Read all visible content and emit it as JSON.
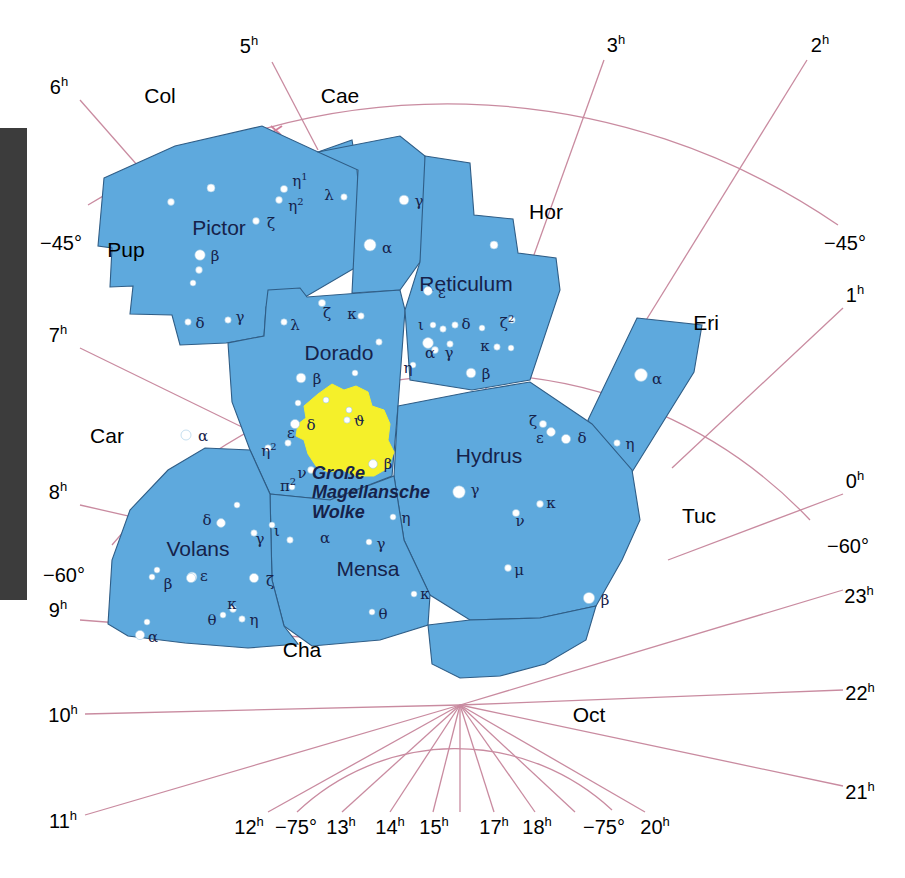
{
  "chart": {
    "colors": {
      "constellation_fill": "#5ea9dd",
      "constellation_border": "#2f5d86",
      "grid_line": "#c98ba0",
      "nebula_fill": "#f5f02a",
      "star_fill": "#ffffff",
      "star_stroke": "#9fc9e4",
      "label_dark": "#16224a",
      "label_black": "#000000",
      "edge_bar": "#3c3c3c",
      "background": "#ffffff"
    }
  },
  "coordinate_labels": [
    {
      "text": "5",
      "sup": "h",
      "x": 249,
      "y": 45
    },
    {
      "text": "3",
      "sup": "h",
      "x": 616,
      "y": 44
    },
    {
      "text": "2",
      "sup": "h",
      "x": 820,
      "y": 44
    },
    {
      "text": "6",
      "sup": "h",
      "x": 59,
      "y": 86
    },
    {
      "text": "−45°",
      "sup": "",
      "x": 61,
      "y": 243
    },
    {
      "text": "−45°",
      "sup": "",
      "x": 845,
      "y": 243
    },
    {
      "text": "1",
      "sup": "h",
      "x": 855,
      "y": 294
    },
    {
      "text": "7",
      "sup": "h",
      "x": 58,
      "y": 334
    },
    {
      "text": "0",
      "sup": "h",
      "x": 855,
      "y": 480
    },
    {
      "text": "8",
      "sup": "h",
      "x": 58,
      "y": 491
    },
    {
      "text": "−60°",
      "sup": "",
      "x": 848,
      "y": 546
    },
    {
      "text": "−60°",
      "sup": "",
      "x": 64,
      "y": 575
    },
    {
      "text": "9",
      "sup": "h",
      "x": 58,
      "y": 609
    },
    {
      "text": "23",
      "sup": "h",
      "x": 859,
      "y": 595
    },
    {
      "text": "22",
      "sup": "h",
      "x": 860,
      "y": 692
    },
    {
      "text": "10",
      "sup": "h",
      "x": 63,
      "y": 714
    },
    {
      "text": "21",
      "sup": "h",
      "x": 860,
      "y": 791
    },
    {
      "text": "11",
      "sup": "h",
      "x": 63,
      "y": 820
    },
    {
      "text": "12",
      "sup": "h",
      "x": 249,
      "y": 826
    },
    {
      "text": "−75°",
      "sup": "",
      "x": 296,
      "y": 827
    },
    {
      "text": "13",
      "sup": "h",
      "x": 341,
      "y": 826
    },
    {
      "text": "14",
      "sup": "h",
      "x": 390,
      "y": 826
    },
    {
      "text": "15",
      "sup": "h",
      "x": 434,
      "y": 826
    },
    {
      "text": "17",
      "sup": "h",
      "x": 494,
      "y": 826
    },
    {
      "text": "18",
      "sup": "h",
      "x": 537,
      "y": 826
    },
    {
      "text": "−75°",
      "sup": "",
      "x": 604,
      "y": 827
    },
    {
      "text": "20",
      "sup": "h",
      "x": 655,
      "y": 826
    }
  ],
  "constellation_abbrs": [
    {
      "label": "Col",
      "x": 160,
      "y": 95
    },
    {
      "label": "Cae",
      "x": 340,
      "y": 95
    },
    {
      "label": "Hor",
      "x": 546,
      "y": 211
    },
    {
      "label": "Eri",
      "x": 706,
      "y": 322
    },
    {
      "label": "Pup",
      "x": 126,
      "y": 249
    },
    {
      "label": "Car",
      "x": 107,
      "y": 435
    },
    {
      "label": "Tuc",
      "x": 699,
      "y": 515
    },
    {
      "label": "Cha",
      "x": 302,
      "y": 649
    },
    {
      "label": "Oct",
      "x": 589,
      "y": 714
    }
  ],
  "constellation_names": [
    {
      "label": "Pictor",
      "x": 219,
      "y": 227
    },
    {
      "label": "Reticulum",
      "x": 466,
      "y": 283
    },
    {
      "label": "Dorado",
      "x": 339,
      "y": 352
    },
    {
      "label": "Hydrus",
      "x": 489,
      "y": 455
    },
    {
      "label": "Volans",
      "x": 198,
      "y": 548
    },
    {
      "label": "Mensa",
      "x": 368,
      "y": 568
    }
  ],
  "nebula_label": {
    "line1": "Große",
    "line2": "Magellansche",
    "line3": "Wolke",
    "x": 312,
    "y": 464
  },
  "stars": [
    {
      "x": 211,
      "y": 188,
      "r": 4.0
    },
    {
      "x": 171,
      "y": 202,
      "r": 3.4
    },
    {
      "x": 284,
      "y": 189,
      "r": 3.6,
      "label": "η",
      "sup": "1",
      "lx": 300,
      "ly": 180
    },
    {
      "x": 279,
      "y": 200,
      "r": 3.4,
      "label": "η",
      "sup": "2",
      "lx": 296,
      "ly": 205
    },
    {
      "x": 344,
      "y": 197,
      "r": 3.2,
      "label": "λ",
      "lx": 329,
      "ly": 195
    },
    {
      "x": 256,
      "y": 221,
      "r": 3.4,
      "label": "ζ",
      "lx": 271,
      "ly": 223
    },
    {
      "x": 404,
      "y": 200,
      "r": 4.8,
      "label": "γ",
      "lx": 419,
      "ly": 201
    },
    {
      "x": 200,
      "y": 255,
      "r": 5.2,
      "label": "β",
      "lx": 215,
      "ly": 256
    },
    {
      "x": 199,
      "y": 270,
      "r": 3.4
    },
    {
      "x": 193,
      "y": 283,
      "r": 3.0
    },
    {
      "x": 370,
      "y": 245,
      "r": 6.0,
      "label": "α",
      "lx": 387,
      "ly": 248
    },
    {
      "x": 228,
      "y": 320,
      "r": 3.2,
      "label": "γ",
      "lx": 240,
      "ly": 317
    },
    {
      "x": 188,
      "y": 322,
      "r": 3.2,
      "label": "δ",
      "lx": 200,
      "ly": 323
    },
    {
      "x": 284,
      "y": 322,
      "r": 3.2,
      "label": "λ",
      "lx": 295,
      "ly": 325
    },
    {
      "x": 322,
      "y": 303,
      "r": 3.6,
      "label": "ζ",
      "lx": 327,
      "ly": 313
    },
    {
      "x": 361,
      "y": 316,
      "r": 3.2,
      "label": "κ",
      "lx": 352,
      "ly": 314
    },
    {
      "x": 379,
      "y": 342,
      "r": 3.2
    },
    {
      "x": 301,
      "y": 378,
      "r": 4.8,
      "label": "β",
      "lx": 317,
      "ly": 379
    },
    {
      "x": 355,
      "y": 373,
      "r": 3.0
    },
    {
      "x": 298,
      "y": 403,
      "r": 3.0
    },
    {
      "x": 326,
      "y": 400,
      "r": 3.0
    },
    {
      "x": 349,
      "y": 410,
      "r": 3.0
    },
    {
      "x": 295,
      "y": 424,
      "r": 4.6,
      "label": "δ",
      "lx": 311,
      "ly": 425
    },
    {
      "x": 288,
      "y": 443,
      "r": 3.2,
      "label": "ε",
      "lx": 291,
      "ly": 433
    },
    {
      "x": 268,
      "y": 448,
      "r": 3.2,
      "label": "η",
      "sup": "2",
      "lx": 269,
      "ly": 450
    },
    {
      "x": 311,
      "y": 470,
      "r": 3.4,
      "label": "ν",
      "lx": 302,
      "ly": 473
    },
    {
      "x": 292,
      "y": 487,
      "r": 3.0,
      "label": "π",
      "sup": "2",
      "lx": 288,
      "ly": 485
    },
    {
      "x": 428,
      "y": 291,
      "r": 4.4,
      "label": "ε",
      "lx": 442,
      "ly": 293
    },
    {
      "x": 433,
      "y": 325,
      "r": 3.0,
      "label": "ι",
      "lx": 421,
      "ly": 325
    },
    {
      "x": 443,
      "y": 329,
      "r": 3.2
    },
    {
      "x": 455,
      "y": 325,
      "r": 3.2,
      "label": "δ",
      "lx": 466,
      "ly": 324
    },
    {
      "x": 482,
      "y": 328,
      "r": 3.0
    },
    {
      "x": 512,
      "y": 320,
      "r": 3.2,
      "label": "ζ",
      "sup": "2",
      "lx": 507,
      "ly": 322
    },
    {
      "x": 428,
      "y": 343,
      "r": 5.4
    },
    {
      "x": 435,
      "y": 350,
      "r": 3.4,
      "label": "α",
      "lx": 430,
      "ly": 353
    },
    {
      "x": 450,
      "y": 344,
      "r": 3.2,
      "label": "γ",
      "lx": 449,
      "ly": 353
    },
    {
      "x": 497,
      "y": 347,
      "r": 3.2,
      "label": "κ",
      "lx": 485,
      "ly": 346
    },
    {
      "x": 511,
      "y": 348,
      "r": 3.0
    },
    {
      "x": 413,
      "y": 365,
      "r": 3.0,
      "label": "η",
      "lx": 408,
      "ly": 368
    },
    {
      "x": 471,
      "y": 373,
      "r": 4.8,
      "label": "β",
      "lx": 486,
      "ly": 374
    },
    {
      "x": 494,
      "y": 245,
      "r": 4.0
    },
    {
      "x": 641,
      "y": 375,
      "r": 6.4,
      "label": "α",
      "lx": 657,
      "ly": 379
    },
    {
      "x": 617,
      "y": 443,
      "r": 3.2,
      "label": "η",
      "lx": 630,
      "ly": 444
    },
    {
      "x": 543,
      "y": 424,
      "r": 3.6,
      "label": "ζ",
      "lx": 533,
      "ly": 421
    },
    {
      "x": 551,
      "y": 432,
      "r": 4.4,
      "label": "ε",
      "lx": 540,
      "ly": 438
    },
    {
      "x": 566,
      "y": 439,
      "r": 4.6,
      "label": "δ",
      "lx": 582,
      "ly": 438
    },
    {
      "x": 459,
      "y": 492,
      "r": 6.2,
      "label": "γ",
      "lx": 475,
      "ly": 490
    },
    {
      "x": 516,
      "y": 513,
      "r": 3.6,
      "label": "ν",
      "lx": 520,
      "ly": 521
    },
    {
      "x": 540,
      "y": 504,
      "r": 3.4,
      "label": "κ",
      "lx": 551,
      "ly": 503
    },
    {
      "x": 508,
      "y": 568,
      "r": 3.4,
      "label": "μ",
      "lx": 519,
      "ly": 570
    },
    {
      "x": 589,
      "y": 598,
      "r": 5.6,
      "label": "β",
      "lx": 605,
      "ly": 600
    },
    {
      "x": 186,
      "y": 435,
      "r": 5.0,
      "label": "α",
      "lx": 203,
      "ly": 436
    },
    {
      "x": 237,
      "y": 505,
      "r": 3.0
    },
    {
      "x": 221,
      "y": 523,
      "r": 4.4,
      "label": "δ",
      "lx": 207,
      "ly": 520
    },
    {
      "x": 254,
      "y": 533,
      "r": 3.2,
      "label": "γ",
      "lx": 260,
      "ly": 539
    },
    {
      "x": 272,
      "y": 525,
      "r": 3.0,
      "label": "ι",
      "lx": 277,
      "ly": 531
    },
    {
      "x": 192,
      "y": 577,
      "r": 4.8,
      "label": "β",
      "lx": 168,
      "ly": 584
    },
    {
      "x": 152,
      "y": 577,
      "r": 3.0
    },
    {
      "x": 157,
      "y": 570,
      "r": 3.0
    },
    {
      "x": 191,
      "y": 578,
      "r": 4.6,
      "label": "ε",
      "lx": 204,
      "ly": 576
    },
    {
      "x": 254,
      "y": 578,
      "r": 4.6,
      "label": "ζ",
      "lx": 270,
      "ly": 581
    },
    {
      "x": 223,
      "y": 615,
      "r": 3.0,
      "label": "θ",
      "lx": 212,
      "ly": 620
    },
    {
      "x": 233,
      "y": 609,
      "r": 3.4,
      "label": "κ",
      "lx": 232,
      "ly": 604
    },
    {
      "x": 242,
      "y": 619,
      "r": 3.2,
      "label": "η",
      "lx": 254,
      "ly": 620
    },
    {
      "x": 140,
      "y": 635,
      "r": 4.6,
      "label": "α",
      "lx": 153,
      "ly": 637
    },
    {
      "x": 147,
      "y": 622,
      "r": 3.0
    },
    {
      "x": 290,
      "y": 540,
      "r": 3.2,
      "label": "α",
      "lx": 325,
      "ly": 538
    },
    {
      "x": 369,
      "y": 542,
      "r": 3.0,
      "label": "γ",
      "lx": 381,
      "ly": 544
    },
    {
      "x": 393,
      "y": 517,
      "r": 3.0,
      "label": "η",
      "lx": 406,
      "ly": 518
    },
    {
      "x": 414,
      "y": 594,
      "r": 3.0,
      "label": "κ",
      "lx": 425,
      "ly": 594
    },
    {
      "x": 372,
      "y": 612,
      "r": 3.0,
      "label": "θ",
      "lx": 383,
      "ly": 614
    },
    {
      "x": 347,
      "y": 420,
      "r": 3.2,
      "label": "ϑ",
      "lx": 359,
      "ly": 421
    },
    {
      "x": 373,
      "y": 464,
      "r": 4.4,
      "label": "β",
      "lx": 388,
      "ly": 464
    }
  ],
  "icons": {
    "star_marker": "star-dot-icon",
    "grid_cross": "grid-cross-icon"
  }
}
